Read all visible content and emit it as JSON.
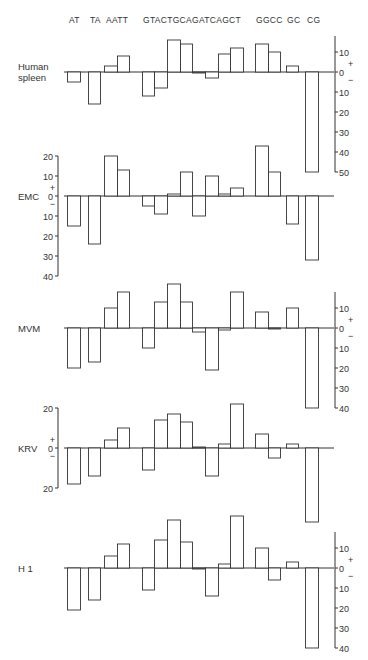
{
  "chart_data": {
    "type": "bar",
    "title": "",
    "xlabel": "",
    "ylabel": "",
    "categories": [
      "AT",
      "TA",
      "AA",
      "TT",
      "GT",
      "AC",
      "TG",
      "CA",
      "GA",
      "TC",
      "AG",
      "CT",
      "GG",
      "CC",
      "GC",
      "CG"
    ],
    "category_header_groups": [
      {
        "label": "AT",
        "cats": [
          "AT"
        ]
      },
      {
        "label": "TA",
        "cats": [
          "TA"
        ]
      },
      {
        "label": "AATT",
        "cats": [
          "AA",
          "TT"
        ]
      },
      {
        "label": "GTACTGCAGATCAGCT",
        "cats": [
          "GT",
          "AC",
          "TG",
          "CA",
          "GA",
          "TC",
          "AG",
          "CT"
        ]
      },
      {
        "label": "GGCC",
        "cats": [
          "GG",
          "CC"
        ]
      },
      {
        "label": "GC",
        "cats": [
          "GC"
        ]
      },
      {
        "label": "CG",
        "cats": [
          "CG"
        ]
      }
    ],
    "header_text": "AT  TA  AATT    GTACTGCAGATCAGCT    GGCC  GC  CG",
    "grid": false,
    "series": [
      {
        "name": "Human spleen",
        "label_lines": [
          "Human",
          "spleen"
        ],
        "axis_side": "right",
        "axis_ticks_above": [
          10
        ],
        "axis_ticks_below": [
          10,
          20,
          30,
          40,
          50
        ],
        "ylim": [
          -50,
          15
        ],
        "values": [
          -5,
          -16,
          3,
          8,
          -12,
          -8,
          16,
          14,
          -0.5,
          -3,
          9,
          12,
          14,
          10,
          3,
          -50
        ]
      },
      {
        "name": "EMC",
        "label_lines": [
          "EMC"
        ],
        "axis_side": "left",
        "axis_ticks_above": [
          10,
          20
        ],
        "axis_ticks_below": [
          10,
          20,
          30,
          40
        ],
        "ylim": [
          -40,
          25
        ],
        "values": [
          -15,
          -24,
          20,
          13,
          -5,
          -9,
          1,
          12,
          -10,
          10,
          1,
          4,
          25,
          12,
          -14,
          -32
        ]
      },
      {
        "name": "MVM",
        "label_lines": [
          "MVM"
        ],
        "axis_side": "right",
        "axis_ticks_above": [
          10
        ],
        "axis_ticks_below": [
          10,
          20,
          30,
          40
        ],
        "ylim": [
          -40,
          23
        ],
        "values": [
          -20,
          -17,
          10,
          18,
          -10,
          13,
          22,
          13,
          -2,
          -21,
          -1,
          18,
          8,
          -0.5,
          10,
          -40
        ]
      },
      {
        "name": "KRV",
        "label_lines": [
          "KRV"
        ],
        "axis_side": "left",
        "axis_ticks_above": [
          20
        ],
        "axis_ticks_below": [
          20
        ],
        "ylim": [
          -37,
          22
        ],
        "values": [
          -18,
          -14,
          4,
          10,
          -11,
          14,
          17,
          13,
          0.5,
          -14,
          2,
          22,
          7,
          -5,
          2,
          -37
        ]
      },
      {
        "name": "H1",
        "label_lines": [
          "H 1"
        ],
        "axis_side": "right",
        "axis_ticks_above": [
          10
        ],
        "axis_ticks_below": [
          10,
          20,
          30,
          40
        ],
        "ylim": [
          -40,
          26
        ],
        "values": [
          -21,
          -16,
          6,
          12,
          -11,
          14,
          24,
          13,
          -0.5,
          -14,
          2,
          26,
          10,
          -6,
          3,
          -40
        ]
      }
    ],
    "sign_labels": {
      "positive": "+",
      "negative": "−",
      "zero": "0"
    }
  },
  "layout": {
    "panel_baselines_y": [
      72,
      196,
      328,
      448,
      568
    ],
    "px_per_unit": 2,
    "bar_x": [
      [
        67,
        80
      ],
      [
        88,
        100
      ],
      [
        104,
        117
      ],
      [
        117,
        129
      ],
      [
        142,
        154
      ],
      [
        154,
        167
      ],
      [
        167,
        180
      ],
      [
        180,
        192
      ],
      [
        192,
        205
      ],
      [
        205,
        218
      ],
      [
        218,
        230
      ],
      [
        230,
        243
      ],
      [
        255,
        268
      ],
      [
        268,
        280
      ],
      [
        286,
        298
      ],
      [
        305,
        318
      ]
    ],
    "baseline_x": [
      64,
      334
    ],
    "left_axis_x": 58,
    "right_axis_x": 335,
    "header_y": 23,
    "header_label_x": [
      {
        "text": "AT",
        "x": 69
      },
      {
        "text": "TA",
        "x": 90
      },
      {
        "text": "AATT",
        "x": 106
      },
      {
        "text": "GTACTGCAGATCAGCT",
        "x": 143
      },
      {
        "text": "GGCC",
        "x": 256
      },
      {
        "text": "GC",
        "x": 287
      },
      {
        "text": "CG",
        "x": 307
      }
    ],
    "label_x": 18
  }
}
